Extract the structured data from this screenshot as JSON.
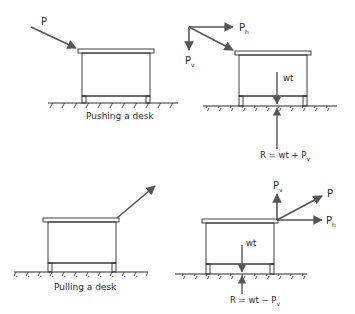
{
  "diagrams": {
    "push": {
      "caption": "Pushing a desk",
      "force_label": "P",
      "components": {
        "horizontal": {
          "main": "P",
          "sub": "h"
        },
        "vertical": {
          "main": "P",
          "sub": "v"
        }
      },
      "weight_label": "wt",
      "reaction_label": "R = wt + P",
      "reaction_sub": "v"
    },
    "pull": {
      "caption": "Pulling a desk",
      "force_label": "P",
      "components": {
        "horizontal": {
          "main": "P",
          "sub": "h"
        },
        "vertical": {
          "main": "P",
          "sub": "v"
        }
      },
      "weight_label": "wt",
      "reaction_label": "R = wt − P",
      "reaction_sub": "v"
    }
  },
  "colors": {
    "line": "#2a2a2a",
    "arrow": "#555555",
    "background": "#ffffff"
  }
}
